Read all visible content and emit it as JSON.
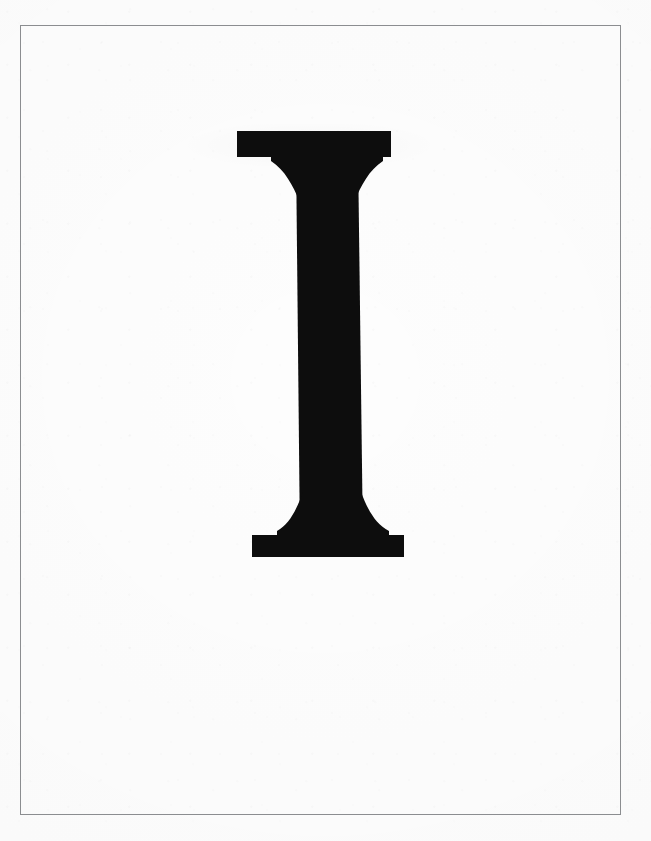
{
  "page": {
    "kind": "scanned-letter-plate",
    "width": 651,
    "height": 841,
    "background_color": "#fdfdfd",
    "caption": ""
  },
  "frame": {
    "name": "plate-border",
    "stroke_color": "#8b8d90",
    "stroke_width_px": 1,
    "left_px": 20,
    "top_px": 25,
    "right_px": 621,
    "bottom_px": 815,
    "width_px": 601,
    "height_px": 790
  },
  "glyph": {
    "character": "I",
    "name": "letter-i",
    "style": "serif-capital-bracketed",
    "ink_color": "#0d0d0d",
    "cap_height_px": 426,
    "top_y_px": 131,
    "bottom_y_px": 557,
    "top_serif": {
      "left_px": 237,
      "right_px": 391,
      "top_px": 131,
      "thickness_px": 26,
      "width_px": 154
    },
    "bottom_serif": {
      "left_px": 252,
      "right_px": 404,
      "top_px": 535,
      "thickness_px": 22,
      "width_px": 152
    },
    "stem": {
      "top_left_px": 296,
      "top_right_px": 358,
      "bottom_left_px": 300,
      "bottom_right_px": 363,
      "width_px": 62
    }
  },
  "colors": {
    "ink": "#0d0d0d",
    "rule": "#8b8d90",
    "paper": "#fdfdfd",
    "paper_outer": "#ffffff"
  }
}
